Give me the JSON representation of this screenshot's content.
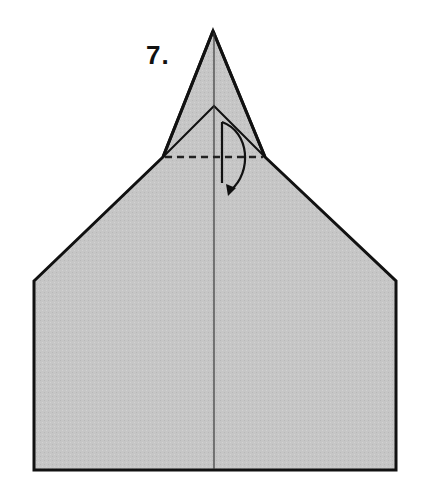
{
  "diagram": {
    "step_label": "7.",
    "colors": {
      "paper_fill": "#c6c6c6",
      "outline": "#111111",
      "crease": "#3a3a3a",
      "background": "#ffffff"
    },
    "shapes": {
      "outer_outline": "34,281 163,157 213,31 265,157 396,281 396,470 34,470",
      "inner_flap": "163,157 214,106 265,157",
      "center_crease": {
        "x": 214,
        "y1": 31,
        "y2": 470
      },
      "valley_fold_line": {
        "x1": 165,
        "x2": 263,
        "y": 157
      },
      "fold_arrow": {
        "line_x": 222,
        "y_top": 122,
        "y_bottom": 183,
        "tip_x": 229,
        "tip_y": 193
      }
    },
    "annotations": {
      "fold_type": "valley fold (dashed line)",
      "arrow": "fold tip down along dashed line"
    }
  }
}
